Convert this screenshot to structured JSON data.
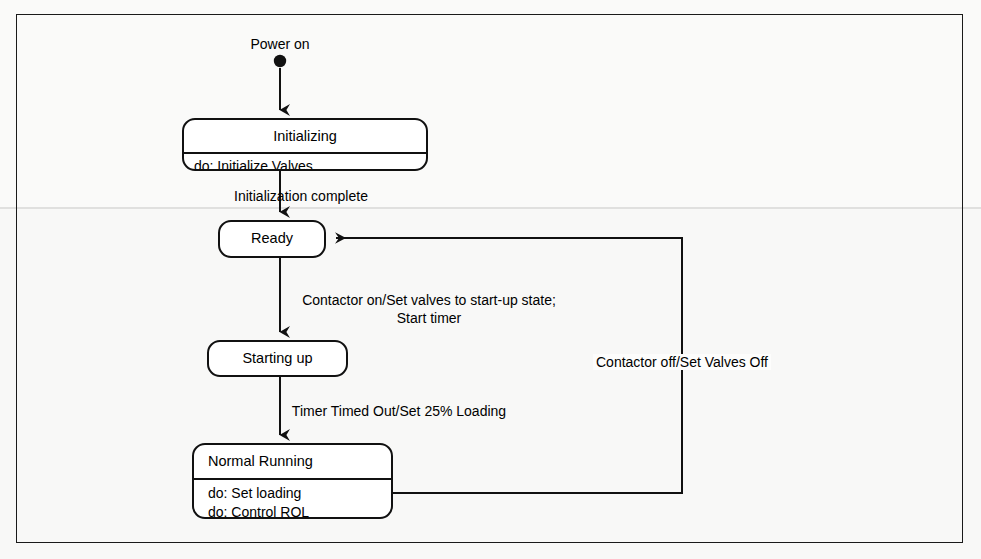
{
  "diagram": {
    "type": "uml-state-machine",
    "frame": {
      "visible": true,
      "border_color": "#1a1a1a"
    },
    "start_marker": {
      "name": "initial-pseudostate",
      "label": "Power on"
    },
    "states": [
      {
        "id": "initializing",
        "name": "Initializing",
        "title_align": "center",
        "activities": [
          "do: Initialize Valves"
        ]
      },
      {
        "id": "ready",
        "name": "Ready",
        "title_align": "center",
        "activities": []
      },
      {
        "id": "starting-up",
        "name": "Starting up",
        "title_align": "center",
        "activities": []
      },
      {
        "id": "normal-running",
        "name": "Normal Running",
        "title_align": "left",
        "activities": [
          "do: Set loading",
          "do: Control ROL"
        ]
      }
    ],
    "transitions": [
      {
        "id": "t-start-initializing",
        "from": "initial-pseudostate",
        "to": "initializing",
        "label": ""
      },
      {
        "id": "t-initializing-ready",
        "from": "initializing",
        "to": "ready",
        "label": "Initialization complete"
      },
      {
        "id": "t-ready-startingup",
        "from": "ready",
        "to": "starting-up",
        "label_line1": "Contactor on/Set valves to start-up state;",
        "label_line2": "Start timer"
      },
      {
        "id": "t-startingup-normalrunning",
        "from": "starting-up",
        "to": "normal-running",
        "label": "Timer Timed Out/Set 25% Loading"
      },
      {
        "id": "t-normalrunning-ready",
        "from": "normal-running",
        "to": "ready",
        "label": "Contactor off/Set Valves Off"
      }
    ]
  }
}
